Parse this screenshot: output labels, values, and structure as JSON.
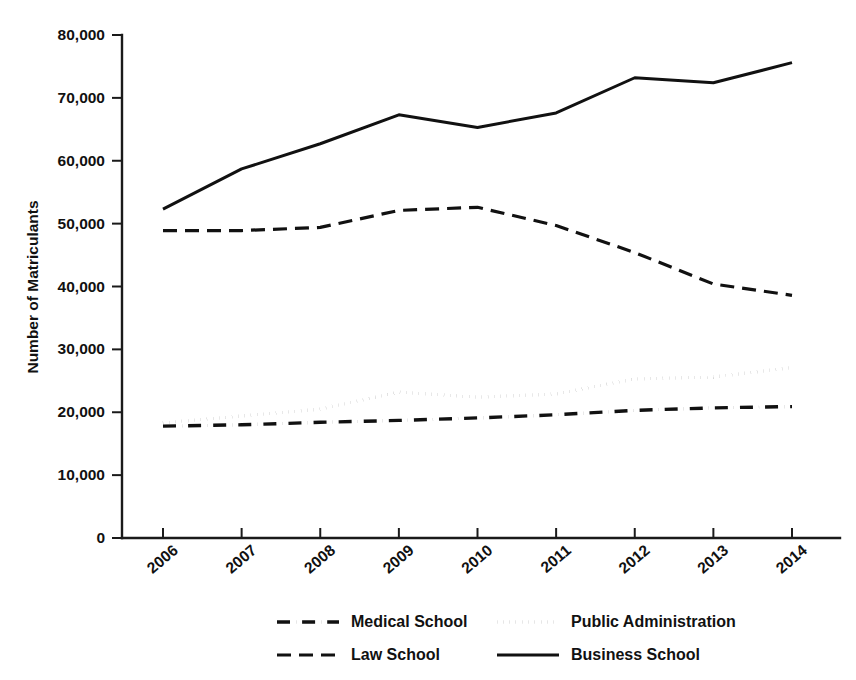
{
  "chart_data": {
    "type": "line",
    "title": "",
    "xlabel": "",
    "ylabel": "Number of Matriculants",
    "x": [
      "2006",
      "2007",
      "2008",
      "2009",
      "2010",
      "2011",
      "2012",
      "2013",
      "2014"
    ],
    "categories": [
      "2006",
      "2007",
      "2008",
      "2009",
      "2010",
      "2011",
      "2012",
      "2013",
      "2014"
    ],
    "xlim": [
      2006,
      2014
    ],
    "ylim": [
      0,
      80000
    ],
    "ytick_labels": [
      "0",
      "10,000",
      "20,000",
      "30,000",
      "40,000",
      "50,000",
      "60,000",
      "70,000",
      "80,000"
    ],
    "ytick_values": [
      0,
      10000,
      20000,
      30000,
      40000,
      50000,
      60000,
      70000,
      80000
    ],
    "grid": false,
    "legend_position": "bottom",
    "series": [
      {
        "name": "Medical School",
        "style": "dash-dot",
        "color": "#111111",
        "values": [
          17800,
          18000,
          18400,
          18700,
          19100,
          19600,
          20300,
          20700,
          20900
        ]
      },
      {
        "name": "Public Administration",
        "style": "dotted",
        "color": "#111111",
        "values": [
          18300,
          19400,
          20500,
          23200,
          22400,
          22900,
          25300,
          25600,
          27100
        ]
      },
      {
        "name": "Law School",
        "style": "dashed",
        "color": "#111111",
        "values": [
          48900,
          48900,
          49400,
          52100,
          52600,
          49700,
          45400,
          40400,
          38600
        ]
      },
      {
        "name": "Business School",
        "style": "solid",
        "color": "#111111",
        "values": [
          52300,
          58700,
          62700,
          67300,
          65300,
          67600,
          73200,
          72400,
          75600
        ]
      }
    ]
  },
  "legend": {
    "entries": [
      {
        "label": "Medical School",
        "style": "dash-dot"
      },
      {
        "label": "Public Administration",
        "style": "dotted"
      },
      {
        "label": "Law School",
        "style": "dashed"
      },
      {
        "label": "Business School",
        "style": "solid"
      }
    ]
  }
}
